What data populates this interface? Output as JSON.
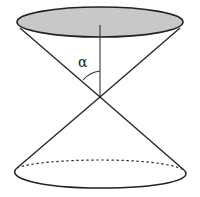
{
  "diagram": {
    "type": "double cone",
    "angle_label": "α",
    "colors": {
      "stroke": "#222222",
      "top_fill": "#c8c8c8",
      "background": "#ffffff"
    },
    "elements": {
      "top_base": "shaded ellipse (upper nappe opening)",
      "bottom_base": "ellipse with hidden back edge dashed",
      "axis": "vertical line from top base center to apex",
      "apex": "intersection point of generatrix lines",
      "angle": "half-angle α between axis and generatrix"
    }
  }
}
